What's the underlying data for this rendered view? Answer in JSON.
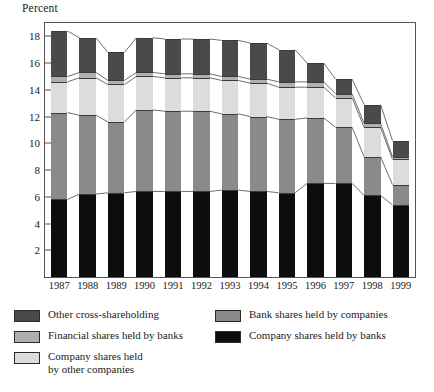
{
  "chart_data": {
    "type": "bar",
    "stacked": true,
    "title": "",
    "ylabel": "Percent",
    "xlabel": "",
    "categories": [
      "1987",
      "1988",
      "1989",
      "1990",
      "1991",
      "1992",
      "1993",
      "1994",
      "1995",
      "1996",
      "1997",
      "1998",
      "1999"
    ],
    "ylim": [
      0,
      19
    ],
    "yticks": [
      2,
      4,
      6,
      8,
      10,
      12,
      14,
      16,
      18
    ],
    "grid": false,
    "legend_position": "bottom",
    "series": [
      {
        "name": "Company shares held by banks",
        "color": "#0d0d0d",
        "values": [
          5.8,
          6.2,
          6.3,
          6.4,
          6.4,
          6.4,
          6.5,
          6.4,
          6.3,
          7.0,
          7.0,
          6.1,
          5.4
        ]
      },
      {
        "name": "Bank shares held by companies",
        "color": "#8a8a8a",
        "values": [
          6.5,
          5.9,
          5.3,
          6.1,
          6.0,
          6.0,
          5.7,
          5.6,
          5.5,
          4.9,
          4.2,
          2.9,
          1.5
        ]
      },
      {
        "name": "Company shares held by other companies",
        "color": "#dcdcdc",
        "values": [
          2.3,
          2.8,
          2.8,
          2.5,
          2.5,
          2.5,
          2.5,
          2.5,
          2.4,
          2.3,
          2.2,
          2.2,
          1.9
        ]
      },
      {
        "name": "Financial shares held by banks",
        "color": "#b0b0b0",
        "values": [
          0.4,
          0.4,
          0.3,
          0.3,
          0.3,
          0.3,
          0.3,
          0.3,
          0.4,
          0.4,
          0.3,
          0.3,
          0.2
        ]
      },
      {
        "name": "Other cross-shareholding",
        "color": "#4a4a4a",
        "values": [
          3.4,
          2.6,
          2.1,
          2.6,
          2.6,
          2.6,
          2.7,
          2.7,
          2.4,
          1.4,
          1.1,
          1.4,
          1.2
        ]
      }
    ],
    "totals": [
      18.4,
      17.9,
      16.8,
      17.9,
      17.8,
      17.8,
      17.7,
      17.5,
      17.0,
      16.0,
      14.8,
      12.9,
      10.2
    ]
  },
  "legend": {
    "left_items": [
      {
        "label": "Other cross-shareholding",
        "color": "#4a4a4a"
      },
      {
        "label": "Financial shares held by banks",
        "color": "#b0b0b0"
      },
      {
        "label": "Company shares held",
        "label2": "by other companies",
        "color": "#dcdcdc"
      }
    ],
    "right_items": [
      {
        "label": "Bank shares held by companies",
        "color": "#8a8a8a"
      },
      {
        "label": "Company shares held by banks",
        "color": "#0d0d0d"
      }
    ]
  }
}
